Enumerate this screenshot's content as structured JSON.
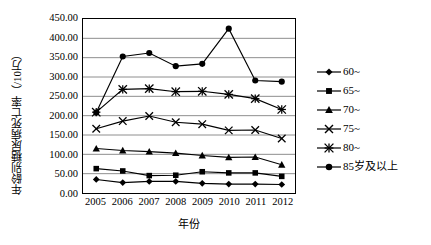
{
  "chart_data": {
    "type": "line",
    "title": "",
    "xlabel": "年份",
    "ylabel": "年龄别糖尿病死亡率（/10万）",
    "categories": [
      "2005",
      "2006",
      "2007",
      "2008",
      "2009",
      "2010",
      "2011",
      "2012"
    ],
    "ylim": [
      0,
      450
    ],
    "ytick_step": 50,
    "ytick_labels": [
      "450.00",
      "400.00",
      "350.00",
      "300.00",
      "250.00",
      "200.00",
      "150.00",
      "100.00",
      "50.00",
      "0.00"
    ],
    "ytick_values": [
      450,
      400,
      350,
      300,
      250,
      200,
      150,
      100,
      50,
      0
    ],
    "grid": "horizontal",
    "legend_position": "right",
    "series": [
      {
        "name": "60~",
        "marker": "diamond",
        "values": [
          35,
          27,
          30,
          30,
          25,
          23,
          23,
          22
        ]
      },
      {
        "name": "65~",
        "marker": "square",
        "values": [
          63,
          57,
          45,
          46,
          55,
          52,
          52,
          43
        ]
      },
      {
        "name": "70~",
        "marker": "triangle",
        "values": [
          115,
          110,
          107,
          103,
          97,
          92,
          93,
          73
        ]
      },
      {
        "name": "75~",
        "marker": "x",
        "values": [
          166,
          186,
          199,
          183,
          178,
          162,
          163,
          141
        ]
      },
      {
        "name": "80~",
        "marker": "asterisk",
        "values": [
          209,
          268,
          270,
          262,
          263,
          255,
          244,
          216
        ]
      },
      {
        "name": "85岁及以上",
        "marker": "circle",
        "values": [
          208,
          353,
          362,
          328,
          334,
          425,
          291,
          288
        ]
      }
    ]
  },
  "legend": {
    "items": [
      {
        "label": "60~"
      },
      {
        "label": "65~"
      },
      {
        "label": "70~"
      },
      {
        "label": "75~"
      },
      {
        "label": "80~"
      },
      {
        "label": "85岁及以上"
      }
    ]
  },
  "colors": {
    "series": "#000000",
    "grid": "#808080",
    "axis": "#000000",
    "background": "#ffffff"
  }
}
